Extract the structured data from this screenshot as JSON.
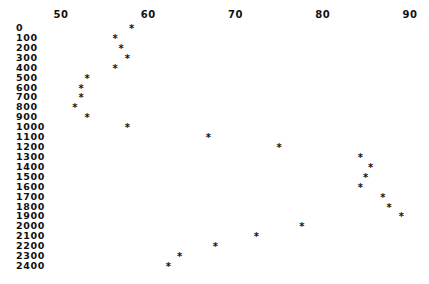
{
  "chart_data": {
    "type": "scatter",
    "title": "",
    "xlabel": "",
    "ylabel": "",
    "x_axis_position": "top",
    "y_axis_inverted": true,
    "xlim": [
      50,
      90
    ],
    "ylim": [
      0,
      2400
    ],
    "grid": false,
    "legend": null,
    "marker": "*",
    "x_ticks": [
      "50",
      "60",
      "70",
      "80",
      "90"
    ],
    "y_ticks": [
      "0",
      "100",
      "200",
      "300",
      "400",
      "500",
      "600",
      "700",
      "800",
      "900",
      "1000",
      "1100",
      "1200",
      "1300",
      "1400",
      "1500",
      "1600",
      "1700",
      "1800",
      "1900",
      "2000",
      "2100",
      "2200",
      "2300",
      "2400"
    ],
    "points": [
      {
        "y": 0,
        "x": 58.1
      },
      {
        "y": 100,
        "x": 56.2
      },
      {
        "y": 200,
        "x": 56.9
      },
      {
        "y": 300,
        "x": 57.6
      },
      {
        "y": 400,
        "x": 56.2
      },
      {
        "y": 500,
        "x": 53.0
      },
      {
        "y": 600,
        "x": 52.3
      },
      {
        "y": 700,
        "x": 52.3
      },
      {
        "y": 800,
        "x": 51.6
      },
      {
        "y": 900,
        "x": 53.0
      },
      {
        "y": 1000,
        "x": 57.6
      },
      {
        "y": 1100,
        "x": 66.9
      },
      {
        "y": 1200,
        "x": 75.0
      },
      {
        "y": 1300,
        "x": 84.3
      },
      {
        "y": 1400,
        "x": 85.5
      },
      {
        "y": 1500,
        "x": 84.9
      },
      {
        "y": 1600,
        "x": 84.3
      },
      {
        "y": 1700,
        "x": 86.9
      },
      {
        "y": 1800,
        "x": 87.6
      },
      {
        "y": 1900,
        "x": 89.0
      },
      {
        "y": 2000,
        "x": 77.6
      },
      {
        "y": 2100,
        "x": 72.4
      },
      {
        "y": 2200,
        "x": 67.7
      },
      {
        "y": 2300,
        "x": 63.6
      },
      {
        "y": 2400,
        "x": 62.3
      }
    ]
  },
  "layout": {
    "x_px": {
      "min_val": 50,
      "max_val": 90,
      "min_px": 61,
      "max_px": 410
    },
    "y_px": {
      "min_val": 0,
      "max_val": 2400,
      "min_px": 28,
      "max_px": 266
    }
  }
}
